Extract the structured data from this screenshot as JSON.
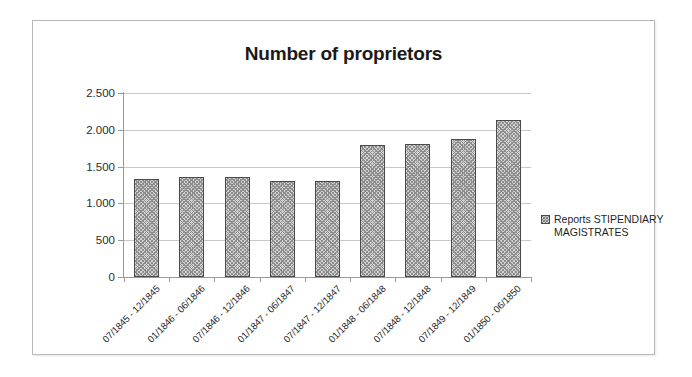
{
  "chart_data": {
    "type": "bar",
    "title": "Number of proprietors",
    "xlabel": "",
    "ylabel": "",
    "ylim": [
      0,
      2500
    ],
    "ytick_labels": [
      "2.500",
      "2.000",
      "1.500",
      "1.000",
      "500",
      "0"
    ],
    "ytick_values": [
      2500,
      2000,
      1500,
      1000,
      500,
      0
    ],
    "grid": true,
    "legend_position": "right",
    "categories": [
      "07/1845 - 12/1845",
      "01/1846 - 06/1846",
      "07/1846 - 12/1846",
      "01/1847 - 06/1847",
      "07/1847 - 12/1847",
      "01/1848 - 06/1848",
      "07/1848 - 12/1848",
      "07/1849 - 12/1849",
      "01/1850 - 06/1850"
    ],
    "series": [
      {
        "name": "Reports STIPENDIARY MAGISTRATES",
        "values": [
          1330,
          1360,
          1360,
          1300,
          1300,
          1800,
          1810,
          1880,
          2140
        ]
      }
    ]
  },
  "legend": {
    "swatch_icon": "crosshatch-square-icon",
    "label": "Reports STIPENDIARY MAGISTRATES"
  }
}
